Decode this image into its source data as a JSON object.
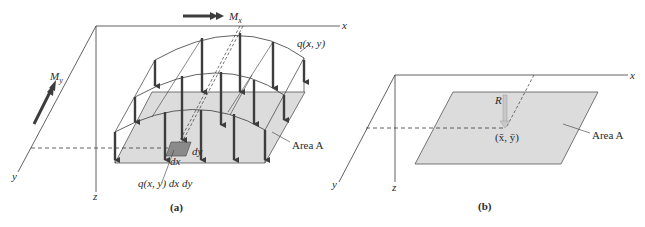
{
  "figure": {
    "panel_a": {
      "caption": "(a)",
      "axes": {
        "x": "x",
        "y": "y",
        "z": "z"
      },
      "moment_x": {
        "symbol": "M",
        "subscript": "x"
      },
      "moment_y": {
        "symbol": "M",
        "subscript": "y"
      },
      "load_label": "q(x, y)",
      "element_load_label": "q(x, y) dx dy",
      "dx_label": "dx",
      "dy_label": "dy",
      "area_label": "Area A"
    },
    "panel_b": {
      "caption": "(b)",
      "axes": {
        "x": "x",
        "y": "y",
        "z": "z"
      },
      "resultant_label": "R",
      "centroid_label": "(x̄, ȳ)",
      "area_label": "Area A"
    },
    "colors": {
      "line": "#3a3a3a",
      "arrow": "#3d3d3d",
      "plate_fill": "#dcdcdc",
      "element_fill": "#8a8a8a",
      "resultant_arrow": "#c8c8c8"
    }
  }
}
